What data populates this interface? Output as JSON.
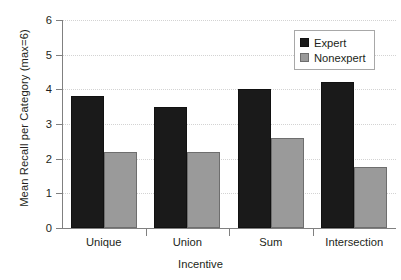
{
  "chart_data": {
    "type": "bar",
    "title": "",
    "xlabel": "Incentive",
    "ylabel": "Mean Recall per Category (max=6)",
    "categories": [
      "Unique",
      "Union",
      "Sum",
      "Intersection"
    ],
    "series": [
      {
        "name": "Expert",
        "color": "#1a1a1a",
        "values": [
          3.8,
          3.5,
          4.0,
          4.2
        ]
      },
      {
        "name": "Nonexpert",
        "color": "#9a9a9a",
        "values": [
          2.2,
          2.2,
          2.6,
          1.75
        ]
      }
    ],
    "ylim": [
      0,
      6
    ],
    "yticks": [
      0,
      1,
      2,
      3,
      4,
      5,
      6
    ],
    "ytick_labels": [
      "0",
      "1",
      "2",
      "3",
      "4",
      "5",
      "6"
    ],
    "grid": true,
    "grid_axis": "y",
    "grid_style": "dotted",
    "grid_color": "#d3d3d3",
    "legend_position": "top-right",
    "bar_style": "grouped"
  },
  "axes": {
    "y_title": "Mean Recall per Category (max=6)",
    "x_title": "Incentive"
  },
  "legend": {
    "entries": [
      {
        "label": "Expert",
        "swatch": "black-square-swatch"
      },
      {
        "label": "Nonexpert",
        "swatch": "gray-square-swatch"
      }
    ]
  }
}
